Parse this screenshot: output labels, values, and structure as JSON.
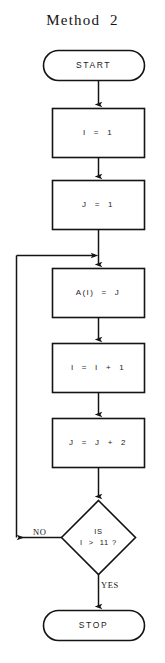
{
  "diagram": {
    "title": "Method  2",
    "type": "flowchart",
    "colors": {
      "background": "#ffffff",
      "stroke": "#141414",
      "text": "#1b1b1b"
    },
    "nodes": [
      {
        "id": "start",
        "shape": "terminator",
        "label": "START"
      },
      {
        "id": "init_i",
        "shape": "process",
        "label": "I  =  1"
      },
      {
        "id": "init_j",
        "shape": "process",
        "label": "J  =  1"
      },
      {
        "id": "assign",
        "shape": "process",
        "label": "A(I)  =  J"
      },
      {
        "id": "inc_i",
        "shape": "process",
        "label": "I  =  I  +  1"
      },
      {
        "id": "inc_j",
        "shape": "process",
        "label": "J  =  J  +  2"
      },
      {
        "id": "test",
        "shape": "decision",
        "label_line1": "IS",
        "label_line2": "I  >  11 ?"
      },
      {
        "id": "stop",
        "shape": "terminator",
        "label": "STOP"
      }
    ],
    "edge_labels": {
      "no": "NO",
      "yes": "YES"
    }
  }
}
